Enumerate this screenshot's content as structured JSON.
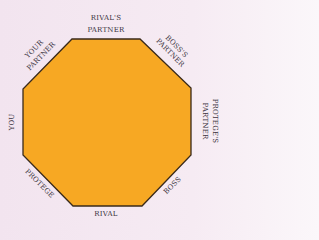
{
  "diagram": {
    "shape": "octagon",
    "fill_color": "#f7a823",
    "stroke_color": "#3a2a1a",
    "background_color": "#f3e6f0",
    "seats": [
      {
        "id": "rivals-partner",
        "lines": [
          "RIVAL'S",
          "PARTNER"
        ],
        "position": "top"
      },
      {
        "id": "boss-partner",
        "lines": [
          "BOSS'S",
          "PARTNER"
        ],
        "position": "top-right"
      },
      {
        "id": "protege-partner",
        "lines": [
          "PROTEGE'S",
          "PARTNER"
        ],
        "position": "right"
      },
      {
        "id": "boss",
        "lines": [
          "BOSS"
        ],
        "position": "bottom-right"
      },
      {
        "id": "rival",
        "lines": [
          "RIVAL"
        ],
        "position": "bottom"
      },
      {
        "id": "protege",
        "lines": [
          "PROTEGE"
        ],
        "position": "bottom-left"
      },
      {
        "id": "you",
        "lines": [
          "YOU"
        ],
        "position": "left"
      },
      {
        "id": "your-partner",
        "lines": [
          "YOUR",
          "PARTNER"
        ],
        "position": "top-left"
      }
    ]
  }
}
